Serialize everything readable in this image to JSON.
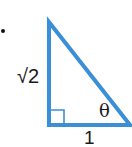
{
  "figure": {
    "type": "right-triangle",
    "bullet": "•",
    "colors": {
      "stroke": "#3a8fd6",
      "text": "#1a1a1a",
      "right_angle_marker": "#3a8fd6"
    },
    "vertices": {
      "top": [
        49,
        22
      ],
      "right_angle": [
        49,
        125
      ],
      "angle_theta": [
        130,
        125
      ]
    },
    "labels": {
      "vertical_leg": "√2",
      "angle": "θ",
      "horizontal_leg": "1"
    }
  }
}
